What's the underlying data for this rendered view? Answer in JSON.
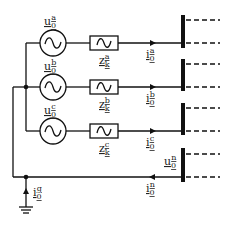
{
  "diagram": {
    "title": "",
    "type": "three-phase circuit with neutral and ground",
    "phases": [
      {
        "id": "a",
        "source_label": "u",
        "source_sub": "0",
        "source_sup": "a",
        "impedance_label": "z",
        "impedance_sub": "k",
        "impedance_sup": "a",
        "current_label": "i",
        "current_sub": "0",
        "current_sup": "a",
        "y": 43
      },
      {
        "id": "b",
        "source_label": "u",
        "source_sub": "0",
        "source_sup": "b",
        "impedance_label": "z",
        "impedance_sub": "k",
        "impedance_sup": "b",
        "current_label": "i",
        "current_sub": "0",
        "current_sup": "b",
        "y": 87
      },
      {
        "id": "c",
        "source_label": "u",
        "source_sub": "0",
        "source_sup": "c",
        "impedance_label": "z",
        "impedance_sub": "k",
        "impedance_sup": "c",
        "current_label": "i",
        "current_sub": "0",
        "current_sup": "c",
        "y": 131
      }
    ],
    "neutral": {
      "voltage_label": "u",
      "voltage_sub": "0",
      "voltage_sup": "n",
      "current_label": "i",
      "current_sub": "0",
      "current_sup": "n",
      "y": 177
    },
    "ground": {
      "current_label": "i",
      "current_sub": "0",
      "current_sup": "g"
    },
    "colors": {
      "line": "#111111",
      "background": "#ffffff"
    }
  }
}
